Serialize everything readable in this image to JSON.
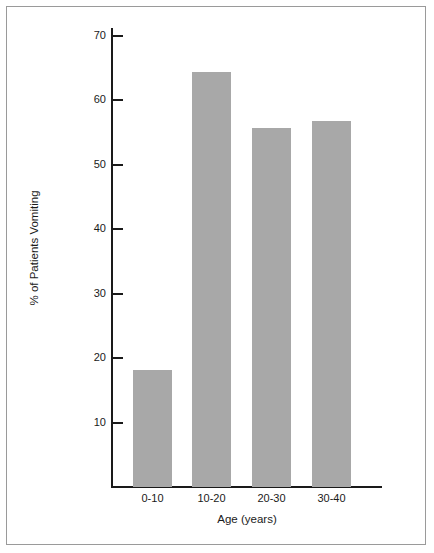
{
  "figure": {
    "background_color": "#ffffff",
    "border_color": "#9a9a9a",
    "axis_color": "#1a1a1a",
    "bar_color": "#a8a8a8"
  },
  "chart_data": {
    "type": "bar",
    "title": "",
    "subtitle": "",
    "categories": [
      "0-10",
      "10-20",
      "20-30",
      "30-40"
    ],
    "values": [
      18.1,
      64.4,
      55.7,
      56.8
    ],
    "xlabel": "Age (years)",
    "ylabel": "% of Patients Vomiting",
    "ylim": [
      0,
      72
    ],
    "yticks": [
      10,
      20,
      30,
      40,
      50,
      60,
      70
    ],
    "ytick_labels": [
      "10",
      "20",
      "30",
      "40",
      "50",
      "60",
      "70"
    ],
    "xtick_labels": [
      "0-10",
      "10-20",
      "20-30",
      "30-40"
    ],
    "grid": false,
    "legend": false,
    "legend_position": "none",
    "tick_direction": "in",
    "annotations": []
  }
}
